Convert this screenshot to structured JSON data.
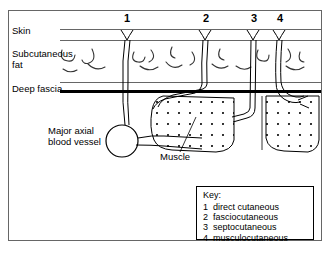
{
  "figure": {
    "type": "anatomical-cross-section",
    "colors": {
      "ink": "#000000",
      "background": "#ffffff",
      "layer_line": "#555555"
    }
  },
  "layer_labels": [
    {
      "text": "Skin",
      "x": 12,
      "y": 29
    },
    {
      "text": "Subcutaneous\nfat",
      "x": 12,
      "y": 52
    },
    {
      "text": "Deep fascia",
      "x": 12,
      "y": 86
    }
  ],
  "callouts": [
    {
      "text": "Major axial\nblood vessel",
      "x": 48,
      "y": 127
    },
    {
      "text": "Muscle",
      "x": 160,
      "y": 155
    }
  ],
  "vessel_numbers": [
    {
      "label": "1",
      "x": 124,
      "y": 12
    },
    {
      "label": "2",
      "x": 203,
      "y": 12
    },
    {
      "label": "3",
      "x": 251,
      "y": 12
    },
    {
      "label": "4",
      "x": 277,
      "y": 12
    }
  ],
  "legend": {
    "title": "Key:",
    "items": [
      {
        "num": "1",
        "label": "direct cutaneous"
      },
      {
        "num": "2",
        "label": "fasciocutaneous"
      },
      {
        "num": "3",
        "label": "septocutaneous"
      },
      {
        "num": "4",
        "label": "musculocutaneous"
      }
    ]
  }
}
